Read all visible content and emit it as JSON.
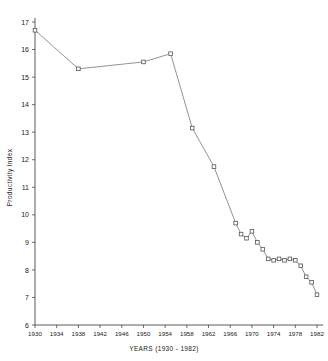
{
  "chart": {
    "xlabel": "YEARS (1930 - 1982)",
    "ylabel": "Productivity Index"
  },
  "chart_data": {
    "type": "line",
    "title": "",
    "xlabel": "YEARS (1930 - 1982)",
    "ylabel": "Productivity Index",
    "xlim": [
      1930,
      1982
    ],
    "ylim": [
      6,
      17
    ],
    "grid": false,
    "legend": false,
    "xticks": [
      1930,
      1934,
      1938,
      1942,
      1946,
      1950,
      1954,
      1958,
      1962,
      1966,
      1970,
      1974,
      1978,
      1982
    ],
    "yticks": [
      6,
      7,
      8,
      9,
      10,
      11,
      12,
      13,
      14,
      15,
      16,
      17
    ],
    "marker": "square-open",
    "series": [
      {
        "name": "Productivity Index",
        "x": [
          1930,
          1938,
          1950,
          1955,
          1959,
          1963,
          1967,
          1968,
          1969,
          1970,
          1971,
          1972,
          1973,
          1974,
          1975,
          1976,
          1977,
          1978,
          1979,
          1980,
          1981,
          1982
        ],
        "values": [
          16.7,
          15.3,
          15.55,
          15.85,
          13.15,
          11.75,
          9.7,
          9.3,
          9.15,
          9.4,
          9.0,
          8.75,
          8.4,
          8.35,
          8.4,
          8.35,
          8.4,
          8.35,
          8.15,
          7.75,
          7.55,
          7.1
        ]
      }
    ]
  }
}
